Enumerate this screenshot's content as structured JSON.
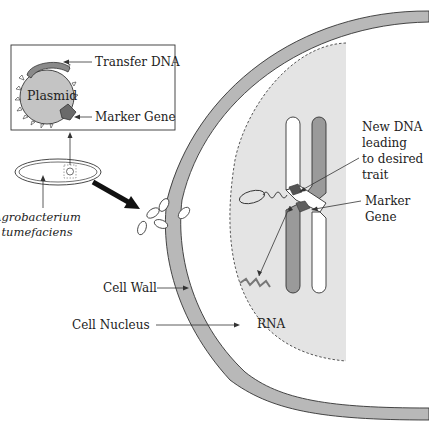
{
  "diagram": {
    "inset": {
      "plasmid_label": "Plasmid",
      "transfer_dna_label": "Transfer DNA",
      "marker_gene_label": "Marker Gene"
    },
    "bacterium": {
      "label_line1": "Agrobacterium",
      "label_line2": "tumefaciens"
    },
    "cell": {
      "cell_wall_label": "Cell Wall",
      "cell_nucleus_label": "Cell Nucleus",
      "rna_label": "RNA",
      "new_dna_label_lines": [
        "New DNA",
        "leading",
        "to desired",
        "trait"
      ],
      "marker_gene_label_lines": [
        "Marker",
        "Gene"
      ]
    },
    "colors": {
      "cell_wall": "#b8b8b8",
      "nucleus_fill": "#e4e4e4",
      "plasmid_fill": "#c4c4c4",
      "transfer_dna": "#8a8a8a",
      "marker_gene": "#6a6a6a",
      "chromatid_dark": "#9a9a9a",
      "outline": "#333333"
    }
  }
}
